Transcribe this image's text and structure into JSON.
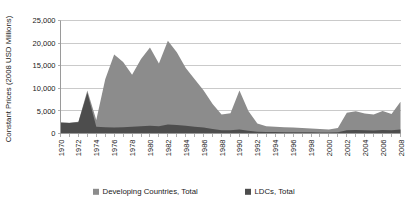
{
  "chart_data": {
    "type": "area",
    "stacked": true,
    "title": "",
    "xlabel": "",
    "ylabel": "Constant Prices (2008 USD Millions)",
    "ylim": [
      0,
      25000
    ],
    "xlim": [
      1970,
      2008
    ],
    "grid": true,
    "legend_position": "bottom",
    "ytick_labels": [
      "0",
      "5,000",
      "10,000",
      "15,000",
      "20,000",
      "25,000"
    ],
    "ytick_values": [
      0,
      5000,
      10000,
      15000,
      20000,
      25000
    ],
    "xtick_labels": [
      "1970",
      "1972",
      "1974",
      "1976",
      "1978",
      "1980",
      "1982",
      "1984",
      "1986",
      "1988",
      "1990",
      "1992",
      "1994",
      "1996",
      "1998",
      "2000",
      "2002",
      "2004",
      "2006",
      "2008"
    ],
    "x": [
      1970,
      1971,
      1972,
      1973,
      1974,
      1975,
      1976,
      1977,
      1978,
      1979,
      1980,
      1981,
      1982,
      1983,
      1984,
      1985,
      1986,
      1987,
      1988,
      1989,
      1990,
      1991,
      1992,
      1993,
      1994,
      1995,
      1996,
      1997,
      1998,
      1999,
      2000,
      2001,
      2002,
      2003,
      2004,
      2005,
      2006,
      2007,
      2008
    ],
    "series": [
      {
        "name": "Developing Countries, Total",
        "color": "#8c8c8c",
        "values": [
          2500,
          2400,
          2600,
          9500,
          3000,
          12000,
          17500,
          15800,
          13000,
          16500,
          19000,
          15500,
          20500,
          18000,
          14500,
          12000,
          9500,
          6500,
          4200,
          4500,
          9500,
          5000,
          2200,
          1600,
          1500,
          1400,
          1300,
          1200,
          1100,
          1000,
          900,
          1200,
          4600,
          4900,
          4400,
          4200,
          5000,
          4300,
          7000
        ]
      },
      {
        "name": "LDCs, Total",
        "color": "#4d4d4d",
        "values": [
          2400,
          2300,
          2500,
          9000,
          1500,
          1400,
          1300,
          1400,
          1500,
          1600,
          1700,
          1600,
          2000,
          1900,
          1700,
          1500,
          1300,
          1000,
          700,
          700,
          900,
          600,
          400,
          350,
          320,
          300,
          280,
          260,
          250,
          240,
          230,
          260,
          700,
          750,
          700,
          680,
          800,
          700,
          900
        ]
      }
    ],
    "legend": [
      {
        "label": "Developing Countries, Total",
        "color": "#8c8c8c"
      },
      {
        "label": "LDCs, Total",
        "color": "#4d4d4d"
      }
    ]
  }
}
